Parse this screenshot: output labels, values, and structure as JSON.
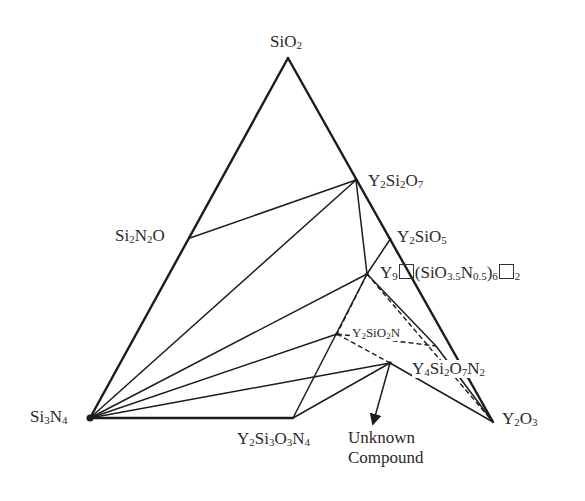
{
  "diagram": {
    "type": "ternary-phase-diagram",
    "system": "Si3N4-SiO2-Y2O3",
    "vertices": {
      "top": "SiO2",
      "bottom_left": "Si3N4",
      "bottom_right": "Y2O3"
    },
    "compounds": [
      {
        "id": "sio2",
        "label": "SiO2"
      },
      {
        "id": "si3n4",
        "label": "Si3N4"
      },
      {
        "id": "y2o3",
        "label": "Y2O3"
      },
      {
        "id": "si2n2o",
        "label": "Si2N2O"
      },
      {
        "id": "y2si2o7",
        "label": "Y2Si2O7"
      },
      {
        "id": "y2sio5",
        "label": "Y2SiO5"
      },
      {
        "id": "apatite",
        "label": "Y9□(SiO3.5N0.5)6□2"
      },
      {
        "id": "y2sio2n",
        "label": "Y2SiO2N"
      },
      {
        "id": "y4si2o7n2",
        "label": "Y4Si2O7N2"
      },
      {
        "id": "y2si3o3n4",
        "label": "Y2Si3O3N4"
      },
      {
        "id": "unknown",
        "label": "Unknown Compound"
      }
    ],
    "tie_lines_solid": [
      [
        "si2n2o",
        "y2si2o7"
      ],
      [
        "si3n4",
        "y2si2o7"
      ],
      [
        "si3n4",
        "apatite"
      ],
      [
        "si3n4",
        "y2sio2n"
      ],
      [
        "si3n4",
        "unknown"
      ],
      [
        "y2si2o7",
        "apatite"
      ],
      [
        "y2sio5",
        "apatite"
      ],
      [
        "apatite",
        "y4si2o7n2"
      ],
      [
        "apatite",
        "y2si3o3n4"
      ],
      [
        "y2si3o3n4",
        "unknown"
      ],
      [
        "unknown",
        "y2o3"
      ],
      [
        "y4si2o7n2",
        "y2o3"
      ]
    ],
    "tie_lines_dashed": [
      [
        "apatite",
        "y2sio2n"
      ],
      [
        "apatite",
        "y2o3"
      ],
      [
        "y2sio2n",
        "unknown"
      ],
      [
        "y2sio2n",
        "y4si2o7n2"
      ]
    ],
    "arrow": {
      "from": "unknown",
      "to_label": "Unknown Compound"
    }
  },
  "labels": {
    "sio2": {
      "main": "SiO",
      "sub1": "2"
    },
    "si3n4": {
      "a": "Si",
      "s1": "3",
      "b": "N",
      "s2": "4"
    },
    "y2o3": {
      "a": "Y",
      "s1": "2",
      "b": "O",
      "s2": "3"
    },
    "si2n2o": {
      "a": "Si",
      "s1": "2",
      "b": "N",
      "s2": "2",
      "c": "O"
    },
    "y2si2o7": {
      "a": "Y",
      "s1": "2",
      "b": "Si",
      "s2": "2",
      "c": "O",
      "s3": "7"
    },
    "y2sio5": {
      "a": "Y",
      "s1": "2",
      "b": "SiO",
      "s2": "5"
    },
    "apatite": {
      "a": "Y",
      "s1": "9",
      "b": "(SiO",
      "s2": "3.5",
      "c": "N",
      "s3": "0.5",
      "d": ")",
      "s4": "6",
      "s5": "2"
    },
    "y2sio2n": {
      "a": "Y",
      "s1": "2",
      "b": "SiO",
      "s2": "2",
      "c": "N"
    },
    "y4si2o7n2": {
      "a": "Y",
      "s1": "4",
      "b": "Si",
      "s2": "2",
      "c": "O",
      "s3": "7",
      "d": "N",
      "s4": "2"
    },
    "y2si3o3n4": {
      "a": "Y",
      "s1": "2",
      "b": "Si",
      "s2": "3",
      "c": "O",
      "s3": "3",
      "d": "N",
      "s4": "4"
    },
    "unknown": {
      "line1": "Unknown",
      "line2": "Compound"
    }
  }
}
